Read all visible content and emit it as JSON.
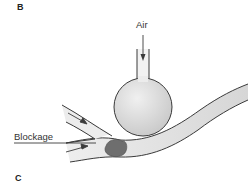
{
  "panels": {
    "top_label": "B",
    "bottom_label": "C"
  },
  "labels": {
    "air": "Air",
    "blockage": "Blockage"
  },
  "colors": {
    "outline": "#3a3a3a",
    "bulb_fill": "#d8d8d8",
    "vessel_fill": "#e4e4e4",
    "blockage_fill": "#6e6e6e"
  },
  "components": [
    "air-inlet-tube",
    "balloon-bulb",
    "blood-vessel",
    "branch-vessel",
    "blockage-clot",
    "flow-arrows"
  ]
}
